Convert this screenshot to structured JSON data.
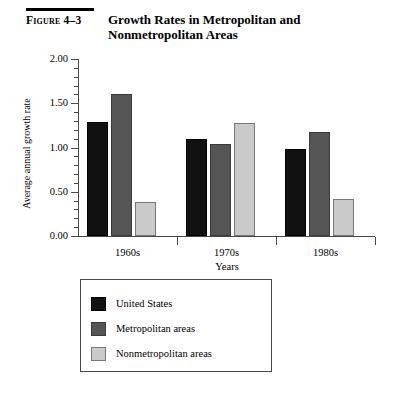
{
  "figure": {
    "label": "Figure 4–3",
    "title": "Growth Rates in Metropolitan and Nonmetropolitan Areas"
  },
  "chart_data": {
    "type": "bar",
    "title": "Growth Rates in Metropolitan and Nonmetropolitan Areas",
    "categories": [
      "1960s",
      "1970s",
      "1980s"
    ],
    "series": [
      {
        "name": "United States",
        "color": "#111111",
        "values": [
          1.29,
          1.1,
          0.98
        ]
      },
      {
        "name": "Metropolitan areas",
        "color": "#555555",
        "values": [
          1.6,
          1.04,
          1.17
        ]
      },
      {
        "name": "Nonmetropolitan areas",
        "color": "#cacaca",
        "values": [
          0.38,
          1.28,
          0.42
        ]
      }
    ],
    "xlabel": "Years",
    "ylabel": "Average annual growth rate",
    "ylim": [
      0.0,
      2.0
    ],
    "ytick_labels": [
      "0.00",
      "0.50",
      "1.00",
      "1.50",
      "2.00"
    ],
    "ytick_values": [
      0.0,
      0.5,
      1.0,
      1.5,
      2.0
    ],
    "yminor_step": 0.1,
    "grid": false,
    "legend_position": "below-plot"
  },
  "legend": {
    "items": [
      {
        "label": "United States"
      },
      {
        "label": "Metropolitan areas"
      },
      {
        "label": "Nonmetropolitan areas"
      }
    ]
  }
}
